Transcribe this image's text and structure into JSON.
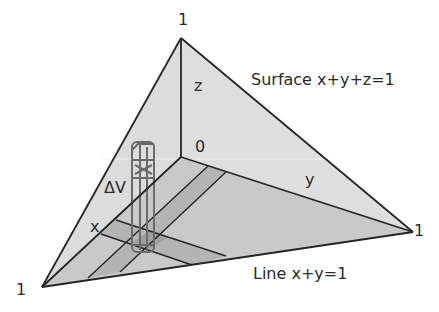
{
  "diagram": {
    "type": "3d-tetrahedron-volume-element",
    "labels": {
      "apex_z": "1",
      "vertex_x": "1",
      "vertex_y": "1",
      "origin": "0",
      "axis_z": "z",
      "axis_x": "x",
      "axis_y": "y",
      "volume_element": "ΔV",
      "surface": "Surface x+y+z=1",
      "line": "Line x+y=1"
    },
    "colors": {
      "face_side": "#d9d9d9",
      "face_base": "#c6c6c6",
      "strip": "#b0b0b0",
      "strip_cross": "#9d9d9d",
      "edge": "#262626",
      "column": "#6b6b6b"
    }
  }
}
